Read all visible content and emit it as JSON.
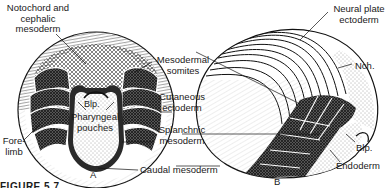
{
  "figure": {
    "caption": "FIGURE 5.7",
    "panels": [
      {
        "id": "A",
        "label": "A"
      },
      {
        "id": "B",
        "label": "B"
      }
    ]
  },
  "labels": {
    "notochord_line1": "Notochord and",
    "notochord_line2": "cephalic",
    "notochord_line3": "mesoderm",
    "mesodermal_line1": "Mesodermal",
    "mesodermal_line2": "somites",
    "cutaneous_line1": "Cutaneous",
    "cutaneous_line2": "ectoderm",
    "splanchnic_line1": "Splanchnic",
    "splanchnic_line2": "mesoderm",
    "caudal": "Caudal mesoderm",
    "blp_a": "Blp.",
    "pharyngeal_line1": "Pharyngeal",
    "pharyngeal_line2": "pouches",
    "forelimb_line1": "Fore-",
    "forelimb_line2": "limb",
    "neural_line1": "Neural plate",
    "neural_line2": "ectoderm",
    "nch": "Nch.",
    "blp_b": "Blp.",
    "endoderm": "Endoderm"
  },
  "colors": {
    "ink": "#1a1a1a",
    "dark_fill": "#3a3a3a",
    "mid_fill": "#8a8a8a",
    "light_fill": "#d8d8d8",
    "background": "#ffffff"
  }
}
